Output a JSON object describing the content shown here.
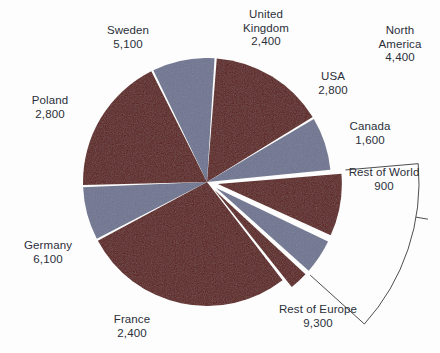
{
  "chart_data": {
    "type": "pie",
    "title": "",
    "subtitle": "",
    "xlabel": "",
    "ylabel": "",
    "legend_position": "none",
    "grid": false,
    "total": 33400,
    "colors": {
      "dark_red": "#5c1a17",
      "blue_gray": "#6e7490",
      "separator": "#ffffff",
      "label_text": "#2b2f3a",
      "bracket_line": "#3a3a3a",
      "background": "#fdfdfd"
    },
    "categories": [
      "Sweden",
      "United Kingdom",
      "USA",
      "Canada",
      "Rest of World",
      "Rest of Europe",
      "France",
      "Germany",
      "Poland"
    ],
    "values": [
      5100,
      2400,
      2800,
      1600,
      900,
      9300,
      2400,
      6100,
      2800
    ],
    "slices": [
      {
        "label": "Sweden",
        "value": 5100,
        "value_text": "5,100",
        "color": "dark_red",
        "exploded": false
      },
      {
        "label": "United Kingdom",
        "value": 2400,
        "value_text": "2,400",
        "color": "blue_gray",
        "exploded": false
      },
      {
        "label": "USA",
        "value": 2800,
        "value_text": "2,800",
        "color": "dark_red",
        "exploded": true
      },
      {
        "label": "Canada",
        "value": 1600,
        "value_text": "1,600",
        "color": "blue_gray",
        "exploded": true
      },
      {
        "label": "Rest of World",
        "value": 900,
        "value_text": "900",
        "color": "dark_red",
        "exploded": true
      },
      {
        "label": "Rest of Europe",
        "value": 9300,
        "value_text": "9,300",
        "color": "dark_red",
        "exploded": false
      },
      {
        "label": "France",
        "value": 2400,
        "value_text": "2,400",
        "color": "blue_gray",
        "exploded": false
      },
      {
        "label": "Germany",
        "value": 6100,
        "value_text": "6,100",
        "color": "dark_red",
        "exploded": false
      },
      {
        "label": "Poland",
        "value": 2800,
        "value_text": "2,800",
        "color": "blue_gray",
        "exploded": false
      }
    ],
    "annotations": [
      {
        "label": "North America",
        "value": 4400,
        "value_text": "4,400",
        "type": "bracket",
        "groups": [
          "USA",
          "Canada"
        ]
      }
    ]
  },
  "labels": {
    "sweden": {
      "name": "Sweden",
      "value": "5,100"
    },
    "united_kingdom": {
      "name": "United Kingdom",
      "name_line1": "United",
      "name_line2": "Kingdom",
      "value": "2,400"
    },
    "usa": {
      "name": "USA",
      "value": "2,800"
    },
    "canada": {
      "name": "Canada",
      "value": "1,600"
    },
    "rest_of_world": {
      "name": "Rest of World",
      "value": "900"
    },
    "rest_of_europe": {
      "name": "Rest of Europe",
      "value": "9,300"
    },
    "france": {
      "name": "France",
      "value": "2,400"
    },
    "germany": {
      "name": "Germany",
      "value": "6,100"
    },
    "poland": {
      "name": "Poland",
      "value": "2,800"
    },
    "north_america": {
      "name": "North America",
      "name_line1": "North",
      "name_line2": "America",
      "value": "4,400"
    }
  }
}
